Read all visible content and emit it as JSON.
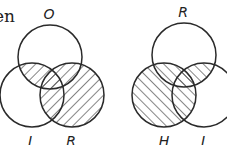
{
  "text_fragment": "en",
  "stroke_color": "#2a2a2a",
  "diagrams": [
    {
      "name": "left-venn",
      "hatch_direction": "backslash",
      "circles": [
        {
          "label": "O",
          "cx": 50,
          "cy": 57,
          "r": 32
        },
        {
          "label": "I",
          "cx": 32,
          "cy": 95,
          "r": 32
        },
        {
          "label": "R",
          "cx": 72,
          "cy": 95,
          "r": 32
        }
      ],
      "shaded_regions": [
        "R",
        "O∩I"
      ],
      "labels": [
        {
          "text": "O",
          "x": 49,
          "y": 19
        },
        {
          "text": "I",
          "x": 30,
          "y": 146
        },
        {
          "text": "R",
          "x": 71,
          "y": 146
        }
      ]
    },
    {
      "name": "right-venn",
      "hatch_direction": "slash",
      "circles": [
        {
          "label": "R",
          "cx": 184,
          "cy": 55,
          "r": 32
        },
        {
          "label": "H",
          "cx": 164,
          "cy": 95,
          "r": 32
        },
        {
          "label": "I",
          "cx": 204,
          "cy": 95,
          "r": 32
        }
      ],
      "shaded_regions": [
        "H",
        "R∩I"
      ],
      "labels": [
        {
          "text": "R",
          "x": 183,
          "y": 17
        },
        {
          "text": "H",
          "x": 164,
          "y": 146
        },
        {
          "text": "I",
          "x": 203,
          "y": 146
        }
      ]
    }
  ]
}
